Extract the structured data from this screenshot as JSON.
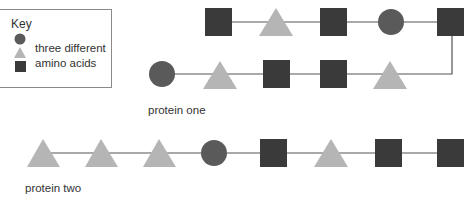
{
  "key": {
    "title": "Key",
    "line1": "three different",
    "line2": "amino acids",
    "symbols": [
      "circle",
      "triangle",
      "square"
    ]
  },
  "colors": {
    "circle": "#5a5a5a",
    "triangle": "#b5b5b5",
    "square": "#3a3a3a",
    "line": "#555555",
    "border": "#8a8a8a"
  },
  "protein_one": {
    "label": "protein one",
    "sequence": [
      "circle",
      "triangle",
      "square",
      "square",
      "triangle",
      "square",
      "circle",
      "square",
      "triangle",
      "square"
    ]
  },
  "protein_two": {
    "label": "protein two",
    "sequence": [
      "triangle",
      "triangle",
      "triangle",
      "circle",
      "square",
      "triangle",
      "square",
      "square"
    ]
  }
}
